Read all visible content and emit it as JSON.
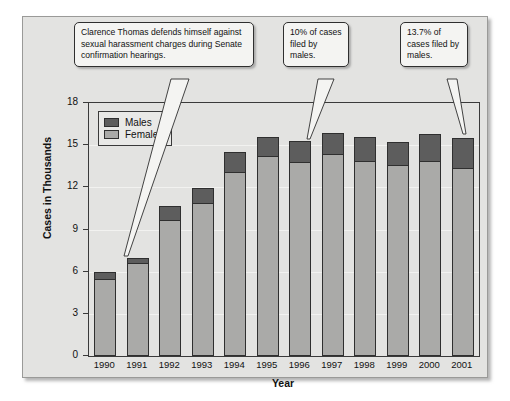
{
  "chart_data": {
    "type": "bar",
    "subtype": "stacked-vertical",
    "title": "",
    "xlabel": "Year",
    "ylabel": "Cases in Thousands",
    "categories": [
      "1990",
      "1991",
      "1992",
      "1993",
      "1994",
      "1995",
      "1996",
      "1997",
      "1998",
      "1999",
      "2000",
      "2001"
    ],
    "series": [
      {
        "name": "Females",
        "color": "#aaaaa8",
        "values": [
          5.5,
          6.6,
          9.7,
          10.9,
          13.1,
          14.2,
          13.8,
          14.4,
          13.9,
          13.6,
          13.9,
          13.4
        ]
      },
      {
        "name": "Males",
        "color": "#5d5d5d",
        "values": [
          0.5,
          0.4,
          1.0,
          1.05,
          1.4,
          1.4,
          1.5,
          1.5,
          1.7,
          1.6,
          1.9,
          2.1
        ]
      }
    ],
    "totals": [
      6.0,
      7.0,
      10.7,
      11.95,
      14.5,
      15.6,
      15.3,
      15.9,
      15.6,
      15.2,
      15.8,
      15.5
    ],
    "ylim": [
      0,
      18
    ],
    "yticks": [
      0,
      3,
      6,
      9,
      12,
      15,
      18
    ],
    "ytick_labels": [
      "0",
      "3",
      "6",
      "9",
      "12",
      "15",
      "18"
    ],
    "grid": true,
    "legend_position": "top-left",
    "annotations": [
      {
        "id": "callout-1",
        "text": "Clarence Thomas defends himself against sexual harassment charges during Senate confirmation hearings.",
        "points_to": "1991"
      },
      {
        "id": "callout-2",
        "text": "10% of cases filed by males.",
        "points_to": "1996"
      },
      {
        "id": "callout-3",
        "text": "13.7% of cases filed by males.",
        "points_to": "2001"
      }
    ]
  },
  "legend": {
    "items": [
      {
        "label": "Males",
        "color": "#5d5d5d"
      },
      {
        "label": "Females",
        "color": "#aaaaa8"
      }
    ]
  },
  "axes": {
    "y_title": "Cases in Thousands",
    "x_title": "Year"
  },
  "colors": {
    "males": "#5d5d5d",
    "females": "#aaaaa8",
    "panel_background": "#e3e3e1",
    "frame": "#3a3a3a"
  }
}
